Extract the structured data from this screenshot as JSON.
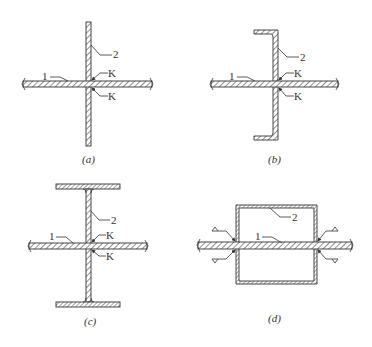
{
  "figure": {
    "panels": [
      {
        "id": "a",
        "caption": "(a)",
        "section": "flat plate",
        "labels": {
          "member1": "1",
          "member2": "2",
          "weld": "K"
        }
      },
      {
        "id": "b",
        "caption": "(b)",
        "section": "channel",
        "labels": {
          "member1": "1",
          "member2": "2",
          "weld": "K"
        }
      },
      {
        "id": "c",
        "caption": "(c)",
        "section": "I-section",
        "labels": {
          "member1": "1",
          "member2": "2",
          "weld": "K"
        }
      },
      {
        "id": "d",
        "caption": "(d)",
        "section": "box section",
        "labels": {
          "member1": "1",
          "member2": "2"
        }
      }
    ],
    "colors": {
      "line": "#333333",
      "background": "#ffffff"
    }
  }
}
